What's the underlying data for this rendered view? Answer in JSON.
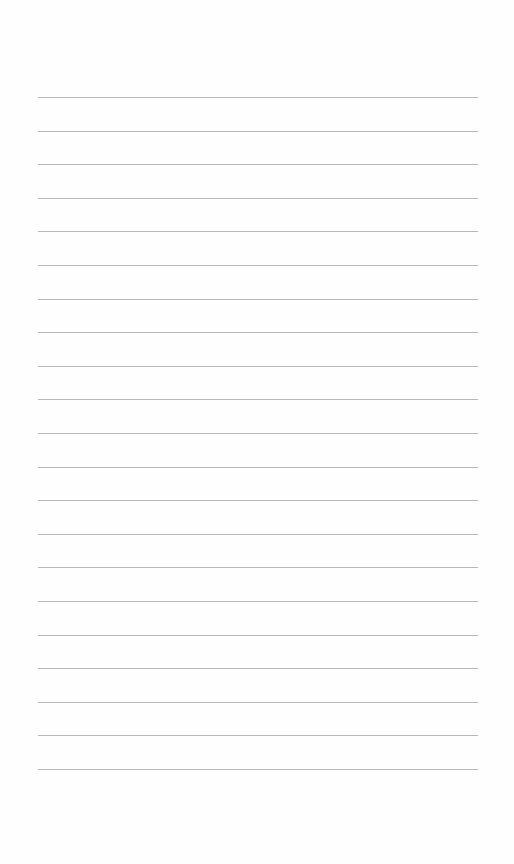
{
  "page": {
    "type": "lined-paper",
    "background_color": "#fefefe",
    "line_color": "#b9b9b9",
    "line_count": 21,
    "first_line_y": 97,
    "line_spacing": 33.6,
    "line_left": 38,
    "line_width": 440
  }
}
